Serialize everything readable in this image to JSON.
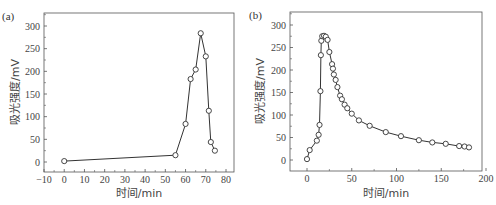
{
  "chart_data": [
    {
      "type": "line",
      "panel_label": "(a)",
      "title": "",
      "xlabel": "时间/min",
      "ylabel": "吸光强度/mV",
      "xlim": [
        -10,
        85
      ],
      "ylim": [
        -25,
        330
      ],
      "xticks": [
        -10,
        0,
        10,
        20,
        30,
        40,
        50,
        60,
        70,
        80
      ],
      "yticks": [
        0,
        50,
        100,
        150,
        200,
        250,
        300
      ],
      "grid": false,
      "marker": "open-circle",
      "series": [
        {
          "name": "a",
          "x": [
            0,
            55,
            60,
            62.5,
            65,
            67.5,
            70,
            71.5,
            72.5,
            74.5
          ],
          "y": [
            2,
            15,
            84,
            183,
            204,
            284,
            233,
            113,
            44,
            25
          ]
        }
      ]
    },
    {
      "type": "line",
      "panel_label": "(b)",
      "title": "",
      "xlabel": "时间/min",
      "ylabel": "吸光强度/mV",
      "xlim": [
        -18,
        200
      ],
      "ylim": [
        -25,
        330
      ],
      "xticks": [
        0,
        50,
        100,
        150,
        200
      ],
      "yticks": [
        0,
        50,
        100,
        150,
        200,
        250,
        300
      ],
      "grid": false,
      "marker": "open-circle",
      "series": [
        {
          "name": "b",
          "x": [
            0,
            3,
            11,
            13,
            14,
            15,
            15.5,
            16,
            17,
            19,
            21,
            23,
            25,
            28,
            29,
            30,
            32,
            34,
            37,
            39,
            42,
            45,
            50,
            58,
            70,
            88,
            105,
            125,
            140,
            155,
            170,
            176,
            181
          ],
          "y": [
            2,
            22,
            43,
            56,
            78,
            153,
            233,
            265,
            275,
            276,
            274,
            267,
            240,
            213,
            203,
            190,
            178,
            162,
            143,
            135,
            123,
            115,
            103,
            88,
            76,
            62,
            53,
            44,
            39,
            36,
            31,
            30,
            28
          ]
        }
      ]
    }
  ],
  "panels": {
    "a": {
      "label": "(a)",
      "xlabel": "时间/min",
      "ylabel": "吸光强度/mV",
      "xtick_labels": [
        "−10",
        "0",
        "10",
        "20",
        "30",
        "40",
        "50",
        "60",
        "70",
        "80"
      ],
      "ytick_labels": [
        "0",
        "50",
        "100",
        "150",
        "200",
        "250",
        "300"
      ]
    },
    "b": {
      "label": "(b)",
      "xlabel": "时间/min",
      "ylabel": "吸光强度/mV",
      "xtick_labels": [
        "0",
        "50",
        "100",
        "150",
        "200"
      ],
      "ytick_labels": [
        "0",
        "50",
        "100",
        "150",
        "200",
        "250",
        "300"
      ]
    }
  },
  "colors": {
    "line": "#333333",
    "axis": "#555555",
    "marker_fill": "#ffffff"
  }
}
